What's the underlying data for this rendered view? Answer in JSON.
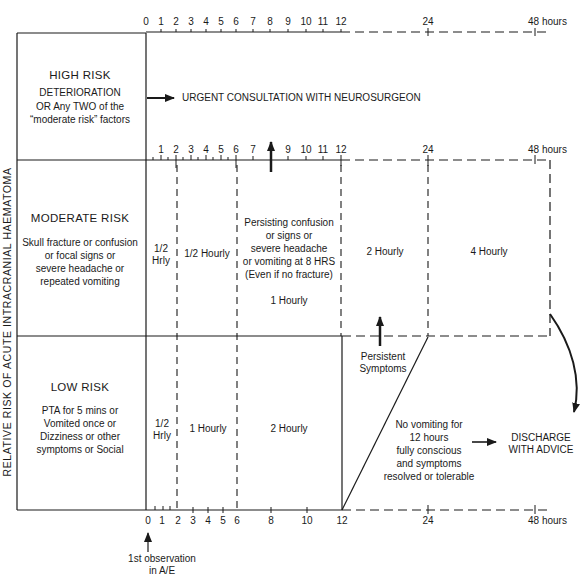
{
  "y_axis_label": "RELATIVE RISK OF ACUTE INTRACRANIAL HAEMATOMA",
  "x_axis": {
    "unit_label": "48 hours",
    "top_ticks": [
      "0",
      "1",
      "2",
      "3",
      "4",
      "5",
      "6",
      "7",
      "8",
      "9",
      "10",
      "11",
      "12",
      "24"
    ],
    "middle_ticks": [
      "1",
      "2",
      "3",
      "4",
      "5",
      "6",
      "7",
      "9",
      "10",
      "11",
      "12",
      "24"
    ],
    "bottom_ticks": [
      "0",
      "1",
      "2",
      "3",
      "4",
      "5",
      "6",
      "8",
      "10",
      "12",
      "24"
    ],
    "start_marker": "1st observation in A/E",
    "start_marker_lines": [
      "1st observation",
      "in A/E"
    ]
  },
  "rows": {
    "high": {
      "title": "HIGH RISK",
      "criteria": [
        "DETERIORATION",
        "OR Any TWO of the",
        "“moderate risk” factors"
      ],
      "action": "URGENT CONSULTATION WITH NEUROSURGEON"
    },
    "moderate": {
      "title": "MODERATE RISK",
      "criteria": [
        "Skull fracture or confusion",
        "or focal signs or",
        "severe headache or",
        "repeated vomiting"
      ],
      "segments": {
        "s0_2": [
          "1/2",
          "Hrly"
        ],
        "s2_6": "1/2 Hourly",
        "s6_12": [
          "Persisting confusion",
          "or signs or",
          "severe headache",
          "or vomiting at 8 HRS",
          "(Even if no fracture)"
        ],
        "s6_12_freq": "1 Hourly",
        "s12_24": "2 Hourly",
        "s24_48": "4 Hourly"
      }
    },
    "low": {
      "title": "LOW RISK",
      "criteria": [
        "PTA for 5 mins or",
        "Vomited once or",
        "Dizziness or other",
        "symptoms or Social"
      ],
      "segments": {
        "s0_2": [
          "1/2",
          "Hrly"
        ],
        "s2_6": "1 Hourly",
        "s6_12": "2 Hourly"
      },
      "persistent_label": [
        "Persistent",
        "Symptoms"
      ],
      "discharge_criteria": [
        "No vomiting for",
        "12 hours",
        "fully conscious",
        "and symptoms",
        "resolved or tolerable"
      ],
      "discharge_action": [
        "DISCHARGE",
        "WITH ADVICE"
      ]
    }
  }
}
